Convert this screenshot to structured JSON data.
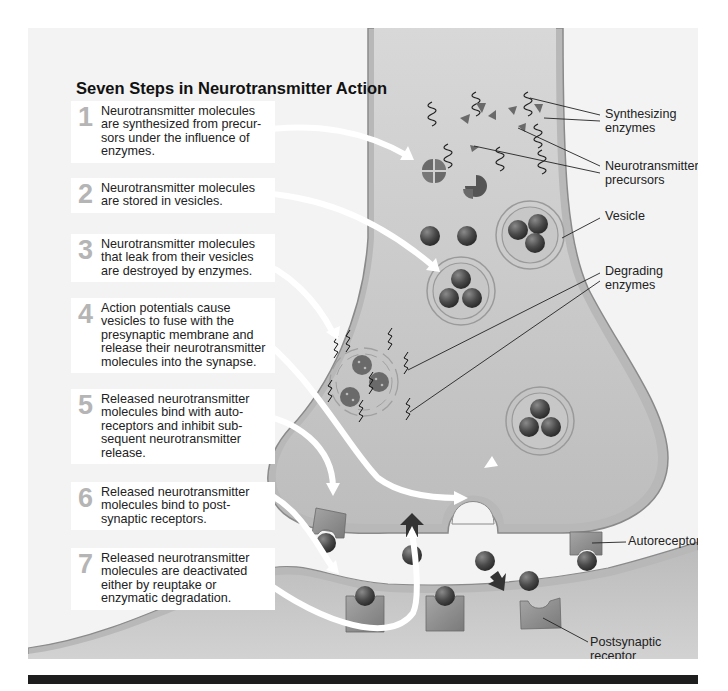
{
  "figure": {
    "title": "Seven Steps in Neurotransmitter Action",
    "steps": [
      {
        "number": "1",
        "lines": [
          "Neurotransmitter molecules",
          "are synthesized from precur-",
          "sors under the influence of",
          "enzymes."
        ]
      },
      {
        "number": "2",
        "lines": [
          "Neurotransmitter molecules",
          "are stored in vesicles."
        ]
      },
      {
        "number": "3",
        "lines": [
          "Neurotransmitter molecules",
          "that leak from their vesicles",
          "are destroyed by enzymes."
        ]
      },
      {
        "number": "4",
        "lines": [
          "Action potentials cause",
          "vesicles to fuse with the",
          "presynaptic membrane and",
          "release their neurotransmitter",
          "molecules into the synapse."
        ]
      },
      {
        "number": "5",
        "lines": [
          "Released neurotransmitter",
          "molecules bind with auto-",
          "receptors and inhibit sub-",
          "sequent neurotransmitter",
          "release."
        ]
      },
      {
        "number": "6",
        "lines": [
          "Released neurotransmitter",
          "molecules bind to post-",
          "synaptic receptors."
        ]
      },
      {
        "number": "7",
        "lines": [
          "Released neurotransmitter",
          "molecules are deactivated",
          "either by reuptake or",
          "enzymatic degradation."
        ]
      }
    ],
    "labels": {
      "synthesizing_enzymes": [
        "Synthesizing",
        "enzymes"
      ],
      "neurotransmitter_precursors": [
        "Neurotransmitter",
        "precursors"
      ],
      "vesicle": [
        "Vesicle"
      ],
      "degrading_enzymes": [
        "Degrading",
        "enzymes"
      ],
      "autoreceptor": [
        "Autoreceptor"
      ],
      "postsynaptic_receptor": [
        "Postsynaptic",
        "receptor"
      ]
    },
    "colors": {
      "background_panel": "#f3f3f3",
      "presynaptic_fill": "#cfcfcf",
      "membrane": "#b8b8b8",
      "membrane_edge": "#8a8a8a",
      "molecule": "#4a4a4a",
      "receptor": "#8c8c8c",
      "step_number": "#b5b5b5",
      "arrow": "#ffffff",
      "footer_bar": "#1e1e1e"
    }
  }
}
